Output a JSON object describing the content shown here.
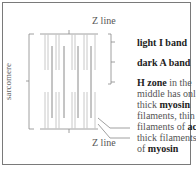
{
  "diagram": {
    "z_line_top": "Z line",
    "z_line_bottom": "Z line",
    "sarcomere_label": "sarcomere",
    "labels": {
      "light_band": "light I band",
      "dark_band": "dark A band",
      "h_zone_bold": "H zone",
      "h_zone_rest_1": " in the",
      "h_zone_line2": "middle has only",
      "h_zone_line3_pre": "thick ",
      "h_zone_line3_bold": "myosin",
      "h_zone_line4": "filaments, thin",
      "actin_pre": "filaments of ",
      "actin_bold": "actin",
      "thick_line1": "thick filaments",
      "thick_pre": "of ",
      "thick_bold": "myosin"
    },
    "colors": {
      "border": "#7a7a7a",
      "thin_filament": "#c8c8c8",
      "thick_filament": "#8a8a8a",
      "lines": "#888888"
    }
  }
}
